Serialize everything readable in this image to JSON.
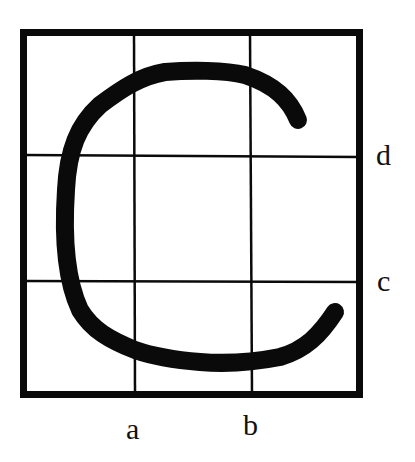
{
  "figure": {
    "grid": {
      "rows": 3,
      "cols": 3,
      "outer_box": {
        "x": 20,
        "y": 29,
        "width": 343,
        "height": 369,
        "stroke_width": 7
      },
      "vertical_lines_x": [
        134,
        250
      ],
      "horizontal_lines_y": [
        155,
        281
      ],
      "inner_stroke_width": 2.5
    },
    "letter": "C",
    "stroke_color": "#0a0a0a",
    "background_color": "#ffffff"
  },
  "labels": {
    "a": "a",
    "b": "b",
    "c": "c",
    "d": "d"
  }
}
